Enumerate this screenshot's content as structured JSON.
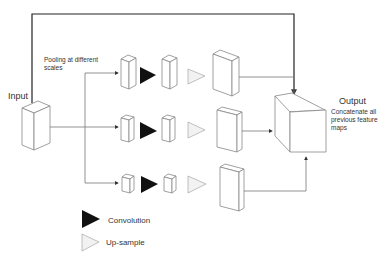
{
  "labels": {
    "input": "Input",
    "output": "Output",
    "output_desc": [
      "Concatenate all",
      "previous feature",
      "maps"
    ],
    "pooling": [
      "Pooling at different",
      "scales"
    ]
  },
  "legend": {
    "convolution": "Convolution",
    "upsample": "Up-sample"
  },
  "colors": {
    "convolution": "#111111",
    "upsample": "#f2f2f2",
    "skip_connection": "#222222",
    "edges": "#777777"
  },
  "branches": [
    {
      "name": "branch-scale-1"
    },
    {
      "name": "branch-scale-2"
    },
    {
      "name": "branch-scale-3"
    }
  ]
}
